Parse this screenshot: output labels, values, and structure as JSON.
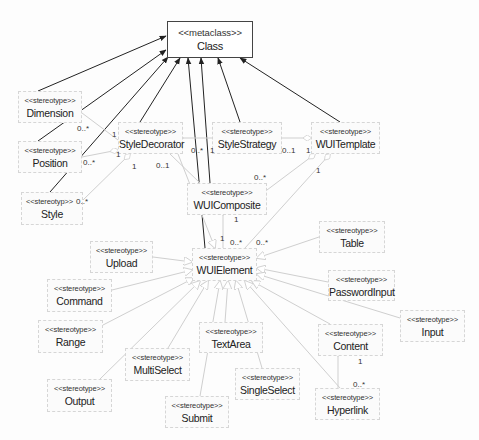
{
  "diagram": {
    "type": "uml-class-profile",
    "metaclass": {
      "stereotype": "<<metaclass>>",
      "name": "Class"
    },
    "stereotypes": [
      {
        "id": "dimension",
        "stereotype": "<<stereotype>>",
        "name": "Dimension"
      },
      {
        "id": "position",
        "stereotype": "<<stereotype>>",
        "name": "Position"
      },
      {
        "id": "style",
        "stereotype": "<<stereotyp>>",
        "name": "Style"
      },
      {
        "id": "styledecorator",
        "stereotype": "<<stereotype>>",
        "name": "StyleDecorator"
      },
      {
        "id": "stylestrategy",
        "stereotype": "<<stereotype>>",
        "name": "StyleStrategy"
      },
      {
        "id": "wuitemplate",
        "stereotype": "<<stereotype>>",
        "name": "WUITemplate"
      },
      {
        "id": "wuicomposite",
        "stereotype": "<<stereotype>>",
        "name": "WUIComposite"
      },
      {
        "id": "wuielement",
        "stereotype": "<<stereotype>>",
        "name": "WUIElement"
      },
      {
        "id": "upload",
        "stereotype": "<<stereotype>>",
        "name": "Upload"
      },
      {
        "id": "command",
        "stereotype": "<<stereotype>>",
        "name": "Command"
      },
      {
        "id": "range",
        "stereotype": "<<stereotype>>",
        "name": "Range"
      },
      {
        "id": "output",
        "stereotype": "<<stereotype>>",
        "name": "Output"
      },
      {
        "id": "multiselect",
        "stereotype": "<<stereotype>>",
        "name": "MultiSelect"
      },
      {
        "id": "submit",
        "stereotype": "<<stereotype>>",
        "name": "Submit"
      },
      {
        "id": "textarea",
        "stereotype": "<<stereotype>>",
        "name": "TextArea"
      },
      {
        "id": "singleselect",
        "stereotype": "<<stereotype>>",
        "name": "SingleSelect"
      },
      {
        "id": "table",
        "stereotype": "<<stereotype>>",
        "name": "Table"
      },
      {
        "id": "passwordinput",
        "stereotype": "<<stereotype>>",
        "name": "PasswordInput"
      },
      {
        "id": "input",
        "stereotype": "<<stereotype>>",
        "name": "Input"
      },
      {
        "id": "content",
        "stereotype": "<<stereotype>>",
        "name": "Content"
      },
      {
        "id": "hyperlink",
        "stereotype": "<<stereotype>>",
        "name": "Hyperlink"
      }
    ],
    "multiplicities": {
      "dim_sd_many": "0..*",
      "dim_sd_one": "1",
      "pos_sd_many": "0..*",
      "pos_sd_one": "1",
      "style_sd_many": "0..*",
      "style_sd_one": "1",
      "sd_comp_01": "0..1",
      "sd_elem_many": "0..*",
      "ss_one": "1",
      "ss_tpl_01": "0..1",
      "tpl_one_a": "1",
      "tpl_one_b": "1",
      "tpl_comp_many": "0..*",
      "comp_one": "1",
      "elem_one": "1",
      "elem_many_a": "0..*",
      "elem_many_b": "0..*",
      "content_one": "1",
      "hyperlink_many": "0..*"
    },
    "colors": {
      "extension_line": "#222222",
      "association_line": "#cfcfcf",
      "box_border": "#d6d6d6"
    }
  }
}
